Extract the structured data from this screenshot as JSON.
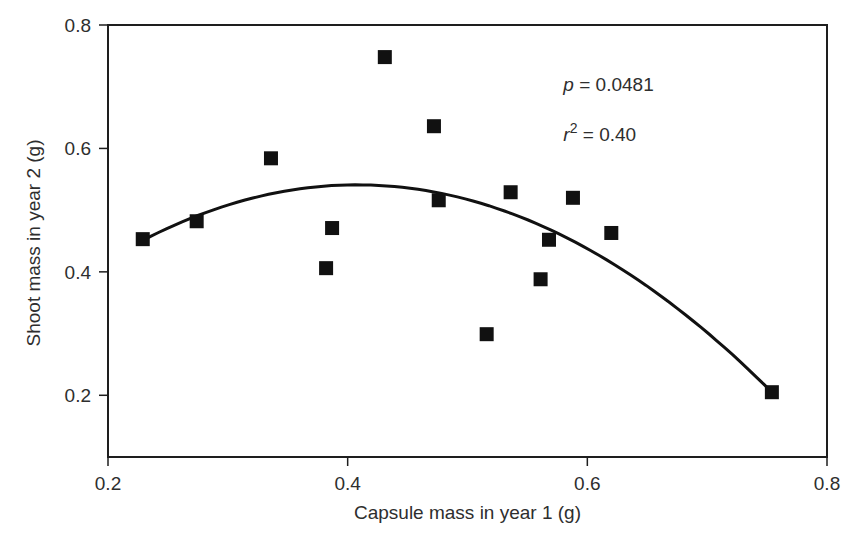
{
  "chart_data": {
    "type": "scatter",
    "title": "",
    "xlabel": "Capsule mass in year 1 (g)",
    "ylabel": "Shoot mass in year 2 (g)",
    "xlim": [
      0.2,
      0.8
    ],
    "ylim": [
      0.1,
      0.8
    ],
    "xticks": [
      0.2,
      0.4,
      0.6,
      0.8
    ],
    "yticks": [
      0.2,
      0.4,
      0.6,
      0.8
    ],
    "xtick_labels": [
      "0.2",
      "0.4",
      "0.6",
      "0.8"
    ],
    "ytick_labels": [
      "0.2",
      "0.4",
      "0.6",
      "0.8"
    ],
    "grid": false,
    "legend": null,
    "series": [
      {
        "name": "observations",
        "marker": "filled-square",
        "color": "#111111",
        "points": [
          {
            "x": 0.229,
            "y": 0.453
          },
          {
            "x": 0.274,
            "y": 0.482
          },
          {
            "x": 0.336,
            "y": 0.584
          },
          {
            "x": 0.382,
            "y": 0.406
          },
          {
            "x": 0.387,
            "y": 0.471
          },
          {
            "x": 0.431,
            "y": 0.748
          },
          {
            "x": 0.472,
            "y": 0.636
          },
          {
            "x": 0.476,
            "y": 0.516
          },
          {
            "x": 0.516,
            "y": 0.299
          },
          {
            "x": 0.536,
            "y": 0.529
          },
          {
            "x": 0.561,
            "y": 0.388
          },
          {
            "x": 0.568,
            "y": 0.452
          },
          {
            "x": 0.588,
            "y": 0.52
          },
          {
            "x": 0.62,
            "y": 0.463
          },
          {
            "x": 0.754,
            "y": 0.205
          }
        ]
      }
    ],
    "fit": {
      "type": "quadratic",
      "vertex": {
        "x": 0.408,
        "y": 0.541
      },
      "x_range": [
        0.229,
        0.754
      ],
      "endpoint_y": 0.205,
      "color": "#111111"
    },
    "annotations": [
      {
        "var": "p",
        "text": " = 0.0481",
        "x": 0.58,
        "y": 0.693
      },
      {
        "var": "r",
        "sup": "2",
        "text": " = 0.40",
        "x": 0.58,
        "y": 0.612
      }
    ]
  },
  "colors": {
    "axis": "#1e1e1e",
    "text": "#2e2e2e",
    "marker": "#111111",
    "background": "#ffffff"
  }
}
